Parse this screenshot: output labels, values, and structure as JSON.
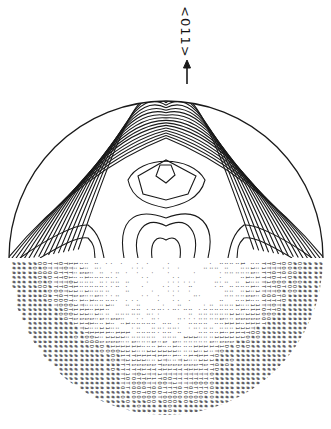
{
  "figure": {
    "direction_label": "<011>",
    "arrow": "up-arrow",
    "center": [
      166,
      258
    ],
    "radius": 157,
    "colors": {
      "ink": "#1a1a1a",
      "background": "#ffffff"
    },
    "upper_half": {
      "type": "contour",
      "description": "Contour lines of intensity, with nested closed contours around central maximum"
    },
    "lower_half": {
      "type": "character-density-map",
      "description": "Rotated line-printer character map of density values",
      "glyph_scale": [
        ".",
        ":",
        "1",
        "T",
        "O",
        "#"
      ]
    }
  }
}
